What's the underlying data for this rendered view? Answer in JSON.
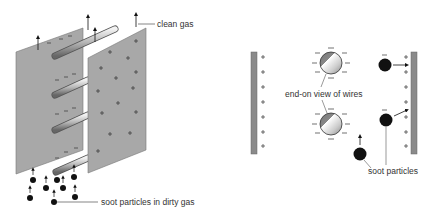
{
  "diagram": {
    "type": "electrostatic precipitator",
    "left_panel": {
      "description": "perspective view of plates and wires",
      "labels": {
        "top": "clean gas",
        "bottom": "soot particles in dirty gas"
      }
    },
    "right_panel": {
      "description": "end-on cross section",
      "labels": {
        "wires": "end-on view of wires",
        "particles": "soot particles"
      }
    },
    "charges": {
      "wire": "−",
      "plate": "+"
    },
    "colors": {
      "plate_fill": "#a8a8a8",
      "plate_stroke": "#6e6e6e",
      "particle": "#111111",
      "text": "#333333"
    }
  }
}
